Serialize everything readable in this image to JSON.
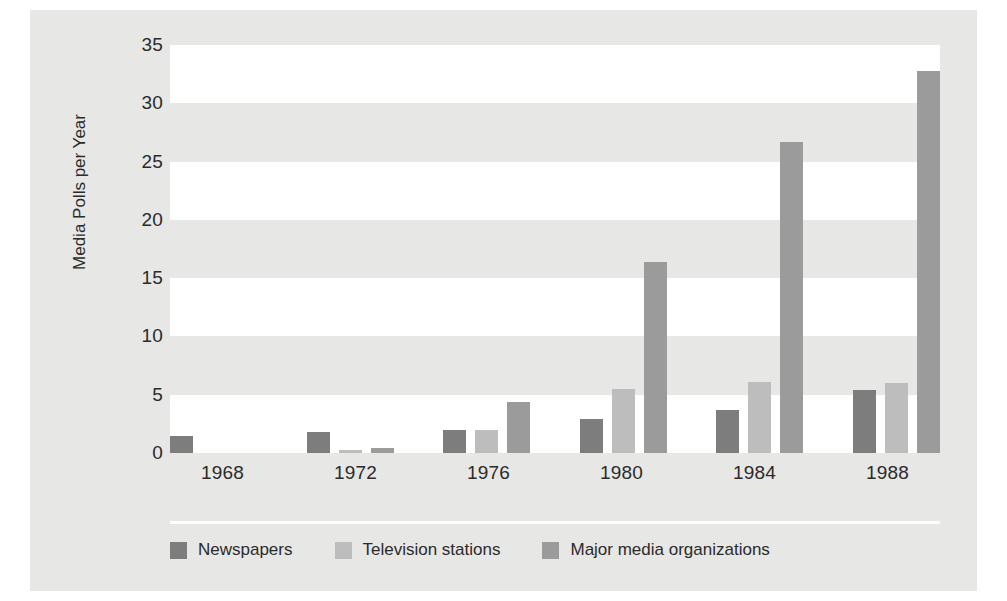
{
  "chart_data": {
    "type": "bar",
    "title": "",
    "xlabel": "",
    "ylabel": "Media Polls per Year",
    "categories": [
      "1968",
      "1972",
      "1976",
      "1980",
      "1984",
      "1988"
    ],
    "series": [
      {
        "name": "Newspapers",
        "color": "#7d7d7d",
        "values": [
          1.5,
          1.8,
          2.0,
          2.9,
          3.7,
          5.4
        ]
      },
      {
        "name": "Television stations",
        "color": "#bdbdbd",
        "values": [
          0,
          0.3,
          2.0,
          5.5,
          6.1,
          6.0
        ]
      },
      {
        "name": "Major media organizations",
        "color": "#9b9b9b",
        "values": [
          0,
          0.4,
          4.4,
          16.4,
          26.7,
          32.8
        ]
      }
    ],
    "ylim": [
      0,
      35
    ],
    "yticks": [
      "35",
      "30",
      "25",
      "20",
      "15",
      "10",
      "5",
      "0"
    ],
    "ytick_values": [
      35,
      30,
      25,
      20,
      15,
      10,
      5,
      0
    ],
    "grid": "alternating-horizontal-bands",
    "legend_position": "bottom-left",
    "background_color": "#e7e7e5",
    "band_color": "#ffffff"
  }
}
